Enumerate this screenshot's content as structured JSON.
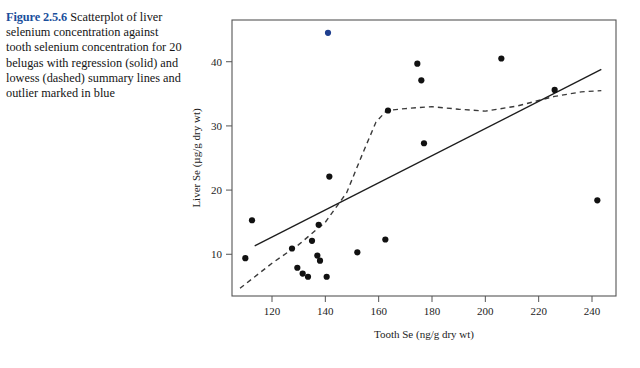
{
  "caption": {
    "figure_number": "Figure 2.5.6",
    "text": "Scatterplot of liver selenium concentration against tooth selenium concentration for 20 belugas with regression (solid) and lowess (dashed) summary lines and outlier marked in blue",
    "number_color": "#1a4f9c"
  },
  "chart_data": {
    "type": "scatter",
    "title": "",
    "xlabel": "Tooth Se (ng/g dry wt)",
    "ylabel": "Liver Se (µg/g dry wt)",
    "xlim": [
      105,
      249
    ],
    "ylim": [
      3.5,
      46.5
    ],
    "xticks": [
      120,
      140,
      160,
      180,
      200,
      220,
      240
    ],
    "yticks": [
      10,
      20,
      30,
      40
    ],
    "grid": false,
    "legend": null,
    "point_color": "#111111",
    "outlier_color": "#1f3f8f",
    "series": [
      {
        "name": "belugas",
        "points": [
          {
            "x": 110.0,
            "y": 9.4,
            "outlier": false
          },
          {
            "x": 112.5,
            "y": 15.3,
            "outlier": false
          },
          {
            "x": 127.5,
            "y": 10.9,
            "outlier": false
          },
          {
            "x": 129.5,
            "y": 7.9,
            "outlier": false
          },
          {
            "x": 131.5,
            "y": 7.0,
            "outlier": false
          },
          {
            "x": 133.5,
            "y": 6.5,
            "outlier": false
          },
          {
            "x": 135.0,
            "y": 12.1,
            "outlier": false
          },
          {
            "x": 137.0,
            "y": 9.8,
            "outlier": false
          },
          {
            "x": 137.5,
            "y": 14.6,
            "outlier": false
          },
          {
            "x": 138.0,
            "y": 9.0,
            "outlier": false
          },
          {
            "x": 140.5,
            "y": 6.5,
            "outlier": false
          },
          {
            "x": 141.0,
            "y": 44.5,
            "outlier": true
          },
          {
            "x": 141.5,
            "y": 22.1,
            "outlier": false
          },
          {
            "x": 152.0,
            "y": 10.3,
            "outlier": false
          },
          {
            "x": 162.5,
            "y": 12.3,
            "outlier": false
          },
          {
            "x": 163.5,
            "y": 32.4,
            "outlier": false
          },
          {
            "x": 174.5,
            "y": 39.7,
            "outlier": false
          },
          {
            "x": 176.0,
            "y": 37.1,
            "outlier": false
          },
          {
            "x": 177.0,
            "y": 27.3,
            "outlier": false
          },
          {
            "x": 206.0,
            "y": 40.5,
            "outlier": false
          },
          {
            "x": 226.0,
            "y": 35.6,
            "outlier": false
          },
          {
            "x": 242.0,
            "y": 18.4,
            "outlier": false
          }
        ]
      }
    ],
    "regression_line": {
      "style": "solid",
      "label": "regression (solid)",
      "points": [
        {
          "x": 113.5,
          "y": 11.3
        },
        {
          "x": 243.5,
          "y": 38.8
        }
      ]
    },
    "lowess_line": {
      "style": "dashed",
      "label": "lowess (dashed)",
      "points": [
        {
          "x": 108.0,
          "y": 4.7
        },
        {
          "x": 120.0,
          "y": 8.6
        },
        {
          "x": 130.0,
          "y": 11.5
        },
        {
          "x": 140.0,
          "y": 15.0
        },
        {
          "x": 148.0,
          "y": 19.6
        },
        {
          "x": 154.0,
          "y": 25.7
        },
        {
          "x": 159.0,
          "y": 30.6
        },
        {
          "x": 163.0,
          "y": 32.4
        },
        {
          "x": 170.0,
          "y": 32.7
        },
        {
          "x": 180.0,
          "y": 33.0
        },
        {
          "x": 190.0,
          "y": 32.6
        },
        {
          "x": 200.0,
          "y": 32.3
        },
        {
          "x": 212.0,
          "y": 33.1
        },
        {
          "x": 226.0,
          "y": 34.6
        },
        {
          "x": 236.0,
          "y": 35.3
        },
        {
          "x": 243.5,
          "y": 35.5
        }
      ]
    }
  }
}
